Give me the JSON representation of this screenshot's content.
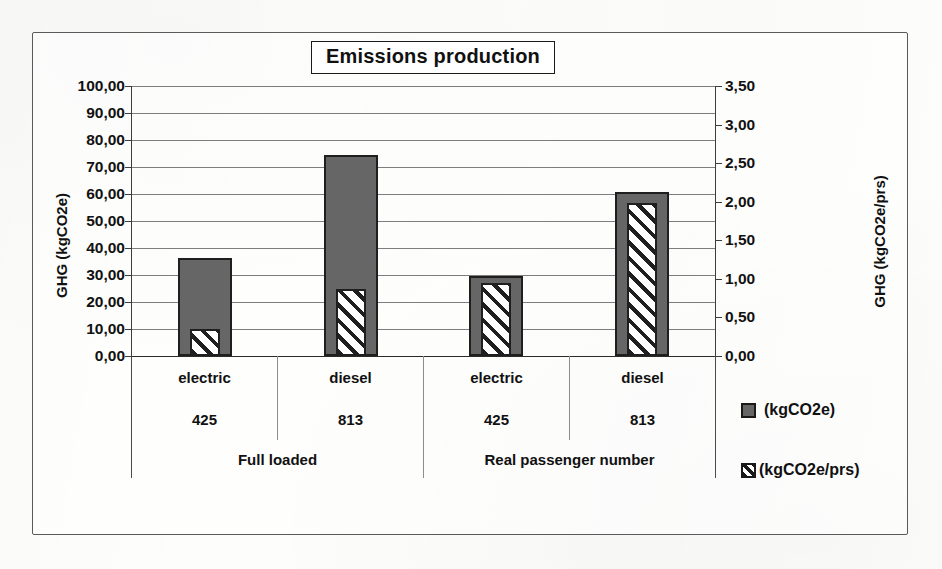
{
  "chart_data": {
    "type": "bar",
    "title": "Emissions production",
    "xlabel": "",
    "ylabel": "GHG (kgCO2e)",
    "y2label": "GHG (kgCO2e/prs)",
    "grid": true,
    "legend_position": "right",
    "ylim": [
      0,
      100
    ],
    "y2lim": [
      0,
      3.5
    ],
    "yticks": [
      "0,00",
      "10,00",
      "20,00",
      "30,00",
      "40,00",
      "50,00",
      "60,00",
      "70,00",
      "80,00",
      "90,00",
      "100,00"
    ],
    "y2ticks": [
      "0,00",
      "0,50",
      "1,00",
      "1,50",
      "2,00",
      "2,50",
      "3,00",
      "3,50"
    ],
    "categories": [
      "electric",
      "diesel",
      "electric",
      "diesel"
    ],
    "category_codes": [
      "425",
      "813",
      "425",
      "813"
    ],
    "groups": [
      {
        "label": "Full loaded",
        "span": 2
      },
      {
        "label": "Real passenger number",
        "span": 2
      }
    ],
    "series": [
      {
        "name": "(kgCO2e)",
        "axis": "left",
        "fill": "solid",
        "values": [
          36.3,
          74.4,
          29.6,
          60.7
        ]
      },
      {
        "name": "(kgCO2e/prs)",
        "axis": "right",
        "fill": "hatched",
        "values": [
          0.35,
          0.87,
          0.95,
          1.98
        ]
      }
    ]
  },
  "chart": {
    "title": "Emissions production",
    "y_left_title": "GHG (kgCO2e)",
    "y_right_title": "GHG (kgCO2e/prs)",
    "y_left_ticks": [
      "100,00",
      "90,00",
      "80,00",
      "70,00",
      "60,00",
      "50,00",
      "40,00",
      "30,00",
      "20,00",
      "10,00",
      "0,00"
    ],
    "y_right_ticks": [
      "3,50",
      "3,00",
      "2,50",
      "2,00",
      "1,50",
      "1,00",
      "0,50",
      "0,00"
    ],
    "categories": [
      {
        "name": "electric",
        "code": "425"
      },
      {
        "name": "diesel",
        "code": "813"
      },
      {
        "name": "electric",
        "code": "425"
      },
      {
        "name": "diesel",
        "code": "813"
      }
    ],
    "groups": [
      "Full loaded",
      "Real passenger number"
    ],
    "legend": [
      {
        "label": "(kgCO2e)",
        "swatch": "solid-gray-swatch"
      },
      {
        "label": "(kgCO2e/prs)",
        "swatch": "hatched-swatch"
      }
    ],
    "colors": {
      "bar_primary": "#666666",
      "bar_outline": "#1f1f1f",
      "bar_secondary_hatch": "#1f1f1f",
      "gridline": "#7d7d7d",
      "frame": "#5a5a5a"
    }
  }
}
